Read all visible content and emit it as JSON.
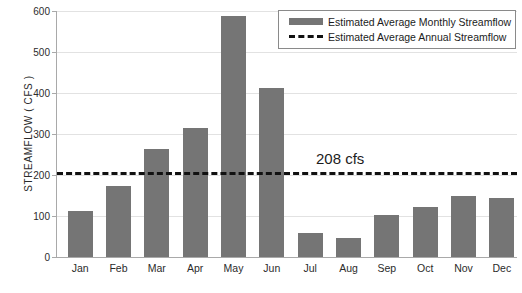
{
  "chart_data": {
    "type": "bar",
    "title": "",
    "xlabel": "",
    "ylabel": "STREAMFLOW ( CFS )",
    "ylim": [
      0,
      600
    ],
    "ytick_labels": [
      "600",
      "500",
      "400",
      "300",
      "200",
      "100",
      "0"
    ],
    "ytick_values": [
      600,
      500,
      400,
      300,
      200,
      100,
      0
    ],
    "grid": true,
    "categories": [
      "Jan",
      "Feb",
      "Mar",
      "Apr",
      "May",
      "Jun",
      "Jul",
      "Aug",
      "Sep",
      "Oct",
      "Nov",
      "Dec"
    ],
    "values": [
      113,
      172,
      263,
      314,
      588,
      412,
      58,
      47,
      102,
      121,
      148,
      144
    ],
    "series": [
      {
        "name": "Estimated Average Monthly Streamflow",
        "values": [
          113,
          172,
          263,
          314,
          588,
          412,
          58,
          47,
          102,
          121,
          148,
          144
        ]
      }
    ],
    "reference_line": {
      "name": "Estimated Average Annual Streamflow",
      "value": 208,
      "label": "208 cfs",
      "style": "dashed"
    },
    "legend_position": "top-right",
    "colors": {
      "bar": "#757575",
      "reference_line": "#111111",
      "gridline": "#e2e2e2",
      "axis": "#a9a9a9",
      "text": "#2b2b2b"
    }
  },
  "legend": {
    "entries": [
      {
        "label": "Estimated Average Monthly Streamflow",
        "marker": "bar-swatch"
      },
      {
        "label": "Estimated Average Annual Streamflow",
        "marker": "dashed-line-swatch"
      }
    ]
  }
}
